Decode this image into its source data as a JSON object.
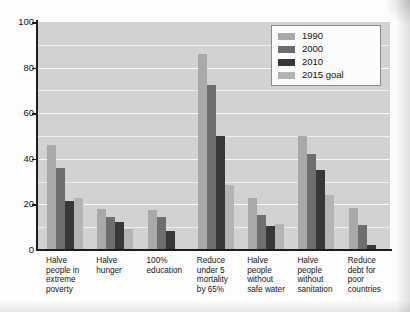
{
  "chart_data": {
    "type": "bar",
    "title": "",
    "xlabel": "",
    "ylabel": "",
    "ylim": [
      0,
      100
    ],
    "ytick_values": [
      0,
      20,
      40,
      60,
      80,
      100
    ],
    "ytick_labels": [
      "0",
      "20",
      "40",
      "60",
      "80",
      "100"
    ],
    "grid": "horizontal",
    "gridline_interval": 10,
    "legend_position": "top-right",
    "categories": [
      "Halve people in extreme poverty",
      "Halve hunger",
      "100% education",
      "Reduce under 5 mortality by 65%",
      "Halve people without safe water",
      "Halve people without sanitation",
      "Reduce debt for poor countries"
    ],
    "category_lines": [
      [
        "Halve",
        "people in",
        "extreme",
        "poverty"
      ],
      [
        "Halve",
        "hunger"
      ],
      [
        "100%",
        "education"
      ],
      [
        "Reduce",
        "under 5",
        "mortality",
        "by 65%"
      ],
      [
        "Halve",
        "people",
        "without",
        "safe water"
      ],
      [
        "Halve",
        "people",
        "without",
        "sanitation"
      ],
      [
        "Reduce",
        "debt for",
        "poor",
        "countries"
      ]
    ],
    "series": [
      {
        "name": "1990",
        "color": "#a9a9a9",
        "values": [
          46,
          18,
          17.5,
          86,
          23,
          50,
          18.5
        ]
      },
      {
        "name": "2000",
        "color": "#6e6e6e",
        "values": [
          36,
          14.5,
          14.5,
          72.5,
          15.5,
          42,
          11
        ]
      },
      {
        "name": "2010",
        "color": "#383838",
        "values": [
          21.5,
          12.5,
          8.5,
          50,
          10.5,
          35,
          2
        ]
      },
      {
        "name": "2015 goal",
        "color": "#b4b4b4",
        "values": [
          23,
          9,
          0.5,
          28.5,
          11.5,
          24,
          0.5
        ]
      }
    ]
  },
  "legend": {
    "entries": [
      {
        "label": "1990",
        "color": "#a9a9a9"
      },
      {
        "label": "2000",
        "color": "#6e6e6e"
      },
      {
        "label": "2010",
        "color": "#383838"
      },
      {
        "label": "2015 goal",
        "color": "#b4b4b4"
      }
    ]
  },
  "colors": {
    "plot_background": "#d2d2d2",
    "gridline": "#efefef",
    "axis": "#1d1d1d",
    "page_background": "#fdfdfd",
    "text": "#111111"
  }
}
